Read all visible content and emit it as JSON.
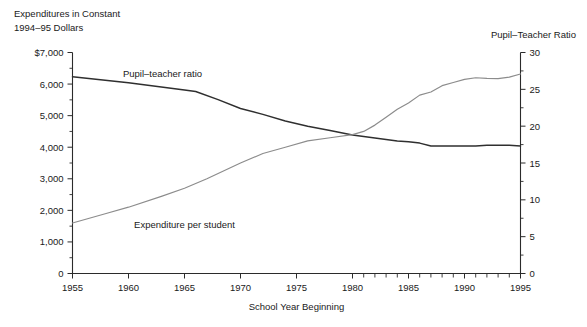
{
  "header": {
    "left_title": "Expenditures in Constant\n1994–95 Dollars",
    "right_title": "Pupil–Teacher Ratio"
  },
  "chart_data": {
    "type": "line",
    "title": "",
    "xlabel": "School Year Beginning",
    "ylabel": "Expenditures in Constant 1994–95 Dollars",
    "y2label": "Pupil–Teacher Ratio",
    "xlim": [
      1955,
      1995
    ],
    "ylim": [
      0,
      7000
    ],
    "y2lim": [
      0,
      30
    ],
    "grid": false,
    "legend_position": "inline-annotations",
    "x_ticks": [
      1955,
      1960,
      1965,
      1970,
      1975,
      1980,
      1985,
      1990,
      1995
    ],
    "x_tick_labels": [
      "1955",
      "1960",
      "1965",
      "1970",
      "1975",
      "1980",
      "1985",
      "1990",
      "1995"
    ],
    "x_minor_ticks": [
      1981,
      1982,
      1983,
      1984,
      1986,
      1987,
      1988,
      1989,
      1991,
      1992,
      1993,
      1994
    ],
    "y_ticks": [
      0,
      1000,
      2000,
      3000,
      4000,
      5000,
      6000,
      7000
    ],
    "y_tick_labels": [
      "0",
      "1,000",
      "2,000",
      "3,000",
      "4,000",
      "5,000",
      "6,000",
      "$7,000"
    ],
    "y_minor_ticks": [
      500,
      1500,
      2500,
      3500,
      4500,
      5500,
      6500
    ],
    "y2_ticks": [
      0,
      5,
      10,
      15,
      20,
      25,
      30
    ],
    "y2_tick_labels": [
      "0",
      "5",
      "10",
      "15",
      "20",
      "25",
      "30"
    ],
    "y2_minor_ticks": [
      2.5,
      7.5,
      12.5,
      17.5,
      22.5,
      27.5
    ],
    "annotations": [
      {
        "text": "Pupil–teacher ratio",
        "x": 1959.5,
        "y_axis": "right",
        "color": "#2f2f2f"
      },
      {
        "text": "Expenditure per student",
        "x": 1960.5,
        "y_axis": "left",
        "color": "#8c8c8c"
      }
    ],
    "series": [
      {
        "name": "Pupil–teacher ratio",
        "axis": "right",
        "units": "students per teacher",
        "color": "#2f2f2f",
        "x": [
          1955,
          1960,
          1965,
          1966,
          1968,
          1970,
          1972,
          1974,
          1976,
          1978,
          1980,
          1981,
          1982,
          1983,
          1984,
          1985,
          1986,
          1987,
          1988,
          1989,
          1990,
          1991,
          1992,
          1993,
          1994,
          1995
        ],
        "values": [
          26.7,
          25.9,
          24.9,
          24.7,
          23.6,
          22.4,
          21.6,
          20.7,
          20.0,
          19.4,
          18.8,
          18.6,
          18.4,
          18.2,
          18.0,
          17.9,
          17.7,
          17.3,
          17.3,
          17.3,
          17.3,
          17.3,
          17.4,
          17.4,
          17.4,
          17.3
        ]
      },
      {
        "name": "Expenditure per student",
        "axis": "left",
        "units": "constant 1994–95 dollars",
        "color": "#8c8c8c",
        "x": [
          1955,
          1958,
          1960,
          1963,
          1965,
          1967,
          1970,
          1972,
          1974,
          1976,
          1978,
          1980,
          1981,
          1982,
          1983,
          1984,
          1985,
          1986,
          1987,
          1988,
          1989,
          1990,
          1991,
          1992,
          1993,
          1994,
          1995
        ],
        "values": [
          1600,
          1900,
          2100,
          2450,
          2700,
          3000,
          3500,
          3800,
          4000,
          4200,
          4300,
          4400,
          4500,
          4700,
          4950,
          5200,
          5400,
          5650,
          5750,
          5950,
          6050,
          6150,
          6200,
          6180,
          6170,
          6220,
          6320
        ]
      }
    ]
  }
}
